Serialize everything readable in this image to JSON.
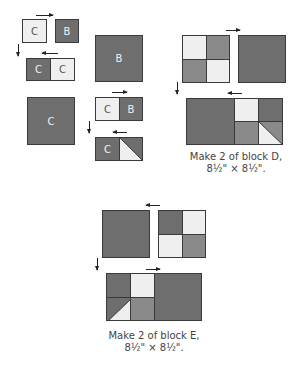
{
  "labels": {
    "c": "C",
    "b": "B"
  },
  "captions": {
    "block_d_line1": "Make 2 of block D,",
    "block_d_line2": "8½\" × 8½\".",
    "block_e_line1": "Make 2 of block E,",
    "block_e_line2": "8½\" × 8½\"."
  },
  "colors": {
    "dark": "#6e6e6e",
    "medium": "#8a8a8a",
    "light": "#efefef",
    "outline": "#3a3a3a"
  }
}
